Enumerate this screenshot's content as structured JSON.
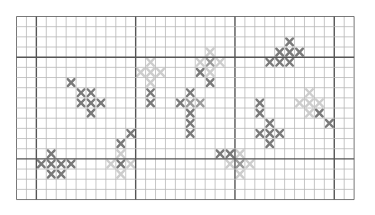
{
  "pattern": {
    "name": "cross-stitch-chart",
    "columns": 34,
    "rows": 18,
    "cell_width": 9.93,
    "cell_height": 10.17,
    "major_every": 10,
    "major_col_offset": 2,
    "major_row_offset": 4,
    "colors": {
      "grid_minor": "#b8b8b8",
      "grid_major": "#555555",
      "dark": "#7a7a7a",
      "medium": "#9c9c9c",
      "light": "#cdcdcd"
    },
    "stitches": [
      {
        "c": 5,
        "r": 6,
        "t": "dark"
      },
      {
        "c": 6,
        "r": 7,
        "t": "dark"
      },
      {
        "c": 7,
        "r": 7,
        "t": "dark"
      },
      {
        "c": 6,
        "r": 8,
        "t": "dark"
      },
      {
        "c": 7,
        "r": 8,
        "t": "dark"
      },
      {
        "c": 8,
        "r": 8,
        "t": "dark"
      },
      {
        "c": 7,
        "r": 9,
        "t": "dark"
      },
      {
        "c": 3,
        "r": 13,
        "t": "dark"
      },
      {
        "c": 2,
        "r": 14,
        "t": "dark"
      },
      {
        "c": 3,
        "r": 14,
        "t": "dark"
      },
      {
        "c": 4,
        "r": 14,
        "t": "dark"
      },
      {
        "c": 5,
        "r": 14,
        "t": "dark"
      },
      {
        "c": 3,
        "r": 15,
        "t": "dark"
      },
      {
        "c": 4,
        "r": 15,
        "t": "dark"
      },
      {
        "c": 11,
        "r": 11,
        "t": "dark"
      },
      {
        "c": 10,
        "r": 12,
        "t": "dark"
      },
      {
        "c": 10,
        "r": 13,
        "t": "light"
      },
      {
        "c": 9,
        "r": 14,
        "t": "light"
      },
      {
        "c": 10,
        "r": 14,
        "t": "dark"
      },
      {
        "c": 11,
        "r": 14,
        "t": "light"
      },
      {
        "c": 10,
        "r": 15,
        "t": "light"
      },
      {
        "c": 13,
        "r": 4,
        "t": "light"
      },
      {
        "c": 12,
        "r": 5,
        "t": "light"
      },
      {
        "c": 13,
        "r": 5,
        "t": "light"
      },
      {
        "c": 14,
        "r": 5,
        "t": "light"
      },
      {
        "c": 13,
        "r": 6,
        "t": "light"
      },
      {
        "c": 13,
        "r": 7,
        "t": "dark"
      },
      {
        "c": 13,
        "r": 8,
        "t": "dark"
      },
      {
        "c": 17,
        "r": 7,
        "t": "dark"
      },
      {
        "c": 16,
        "r": 8,
        "t": "dark"
      },
      {
        "c": 17,
        "r": 8,
        "t": "medium"
      },
      {
        "c": 18,
        "r": 8,
        "t": "medium"
      },
      {
        "c": 17,
        "r": 9,
        "t": "dark"
      },
      {
        "c": 17,
        "r": 10,
        "t": "dark"
      },
      {
        "c": 17,
        "r": 11,
        "t": "dark"
      },
      {
        "c": 19,
        "r": 3,
        "t": "light"
      },
      {
        "c": 18,
        "r": 4,
        "t": "light"
      },
      {
        "c": 19,
        "r": 4,
        "t": "medium"
      },
      {
        "c": 20,
        "r": 4,
        "t": "light"
      },
      {
        "c": 18,
        "r": 5,
        "t": "dark"
      },
      {
        "c": 19,
        "r": 5,
        "t": "light"
      },
      {
        "c": 19,
        "r": 6,
        "t": "dark"
      },
      {
        "c": 20,
        "r": 13,
        "t": "dark"
      },
      {
        "c": 21,
        "r": 13,
        "t": "dark"
      },
      {
        "c": 22,
        "r": 13,
        "t": "light"
      },
      {
        "c": 21,
        "r": 14,
        "t": "light"
      },
      {
        "c": 22,
        "r": 14,
        "t": "medium"
      },
      {
        "c": 23,
        "r": 14,
        "t": "light"
      },
      {
        "c": 22,
        "r": 15,
        "t": "light"
      },
      {
        "c": 24,
        "r": 8,
        "t": "dark"
      },
      {
        "c": 24,
        "r": 9,
        "t": "dark"
      },
      {
        "c": 25,
        "r": 10,
        "t": "dark"
      },
      {
        "c": 24,
        "r": 11,
        "t": "dark"
      },
      {
        "c": 25,
        "r": 11,
        "t": "dark"
      },
      {
        "c": 26,
        "r": 11,
        "t": "dark"
      },
      {
        "c": 25,
        "r": 12,
        "t": "dark"
      },
      {
        "c": 27,
        "r": 2,
        "t": "dark"
      },
      {
        "c": 26,
        "r": 3,
        "t": "dark"
      },
      {
        "c": 27,
        "r": 3,
        "t": "dark"
      },
      {
        "c": 28,
        "r": 3,
        "t": "dark"
      },
      {
        "c": 25,
        "r": 4,
        "t": "dark"
      },
      {
        "c": 26,
        "r": 4,
        "t": "dark"
      },
      {
        "c": 27,
        "r": 4,
        "t": "dark"
      },
      {
        "c": 29,
        "r": 7,
        "t": "light"
      },
      {
        "c": 28,
        "r": 8,
        "t": "light"
      },
      {
        "c": 29,
        "r": 8,
        "t": "light"
      },
      {
        "c": 30,
        "r": 8,
        "t": "light"
      },
      {
        "c": 29,
        "r": 9,
        "t": "light"
      },
      {
        "c": 30,
        "r": 9,
        "t": "dark"
      },
      {
        "c": 31,
        "r": 10,
        "t": "dark"
      }
    ]
  }
}
